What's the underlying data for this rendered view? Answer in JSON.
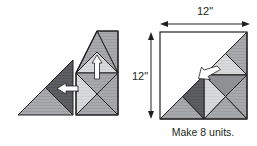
{
  "figure": {
    "title_caption": "Make 8 units.",
    "width_label": "12\"",
    "height_label": "12\"",
    "colors": {
      "outline": "#231f20",
      "dark_gray": "#58585b",
      "medium_gray": "#a7a9ac",
      "light_gray": "#d6d7d9",
      "white": "#ffffff",
      "arrow_fill": "#ffffff",
      "text": "#231f20",
      "dimension_line": "#231f20"
    }
  },
  "left_diagram": {
    "name": "assembly-step-diagram",
    "pieces": [
      {
        "name": "small-half-square-triangle-unit",
        "shade": "medium_gray"
      },
      {
        "name": "small-dark-triangle",
        "shade": "dark_gray"
      },
      {
        "name": "large-pieced-triangle-unit",
        "shade": "medium_gray"
      },
      {
        "name": "hourglass-light-triangle",
        "shade": "light_gray"
      },
      {
        "name": "quarter-square-triangle",
        "shade": "medium_gray"
      }
    ],
    "arrows": [
      {
        "name": "join-arrow-left",
        "direction": "left"
      },
      {
        "name": "join-arrow-up",
        "direction": "up"
      }
    ]
  },
  "right_diagram": {
    "name": "finished-block-diagram",
    "block_shape": "square",
    "width_label": "12\"",
    "height_label": "12\"",
    "caption": "Make 8 units.",
    "arrows": [
      {
        "name": "placement-arrow",
        "direction": "up-left"
      }
    ],
    "dimension_arrows": [
      {
        "name": "top-dimension-arrow",
        "orientation": "horizontal"
      },
      {
        "name": "left-dimension-arrow",
        "orientation": "vertical"
      }
    ]
  }
}
